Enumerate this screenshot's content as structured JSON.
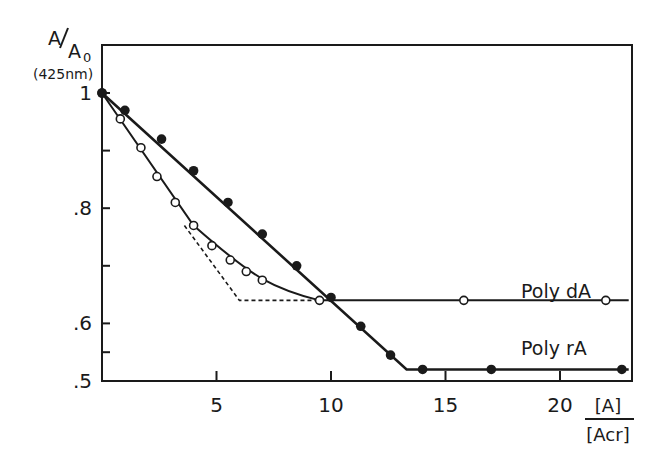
{
  "chart_data": {
    "type": "line",
    "title": "",
    "ylabel": {
      "main": "A/A0",
      "numerator": "A",
      "denominator": "A",
      "subscript": "0",
      "sub": "(425nm)"
    },
    "xlabel": {
      "numerator": "[A]",
      "denominator": "[Acr]"
    },
    "xlim": [
      0,
      23
    ],
    "ylim": [
      0.5,
      1.05
    ],
    "x_ticks": [
      5,
      10,
      15,
      20
    ],
    "x_tick_labels": [
      "5",
      "10",
      "15",
      "20"
    ],
    "y_ticks": [
      0.5,
      0.6,
      0.8,
      1.0
    ],
    "y_tick_labels": [
      ".5",
      ".6",
      ".8",
      "1"
    ],
    "y_minor_ticks": [
      0.55,
      0.7,
      0.9
    ],
    "grid": false,
    "series": [
      {
        "name": "Poly dA",
        "marker": "open-circle",
        "points": [
          [
            0,
            1.0
          ],
          [
            0.8,
            0.955
          ],
          [
            1.7,
            0.905
          ],
          [
            2.4,
            0.855
          ],
          [
            3.2,
            0.81
          ],
          [
            4.0,
            0.77
          ],
          [
            4.8,
            0.735
          ],
          [
            5.6,
            0.71
          ],
          [
            6.3,
            0.69
          ],
          [
            7.0,
            0.675
          ],
          [
            9.5,
            0.64
          ],
          [
            15.8,
            0.64
          ],
          [
            22.0,
            0.64
          ]
        ],
        "fit_line": [
          [
            0,
            1.0
          ],
          [
            4.0,
            0.77
          ],
          [
            6.0,
            0.7
          ],
          [
            8.0,
            0.655
          ],
          [
            9.5,
            0.64
          ],
          [
            23,
            0.64
          ]
        ],
        "extrapolation_dashed": [
          [
            3.6,
            0.77
          ],
          [
            6.0,
            0.64
          ],
          [
            9.5,
            0.64
          ]
        ]
      },
      {
        "name": "Poly rA",
        "marker": "filled-circle",
        "points": [
          [
            0,
            1.0
          ],
          [
            1.0,
            0.97
          ],
          [
            2.6,
            0.92
          ],
          [
            4.0,
            0.865
          ],
          [
            5.5,
            0.81
          ],
          [
            7.0,
            0.755
          ],
          [
            8.5,
            0.7
          ],
          [
            10.0,
            0.645
          ],
          [
            11.3,
            0.595
          ],
          [
            12.6,
            0.545
          ],
          [
            14.0,
            0.52
          ],
          [
            17.0,
            0.52
          ],
          [
            22.7,
            0.52
          ]
        ],
        "fit_line": [
          [
            0,
            1.0
          ],
          [
            13.3,
            0.52
          ],
          [
            23,
            0.52
          ]
        ]
      }
    ],
    "annotations": [
      {
        "text": "Poly dA",
        "x": 18.3,
        "y": 0.655
      },
      {
        "text": "Poly rA",
        "x": 18.3,
        "y": 0.555
      }
    ]
  }
}
